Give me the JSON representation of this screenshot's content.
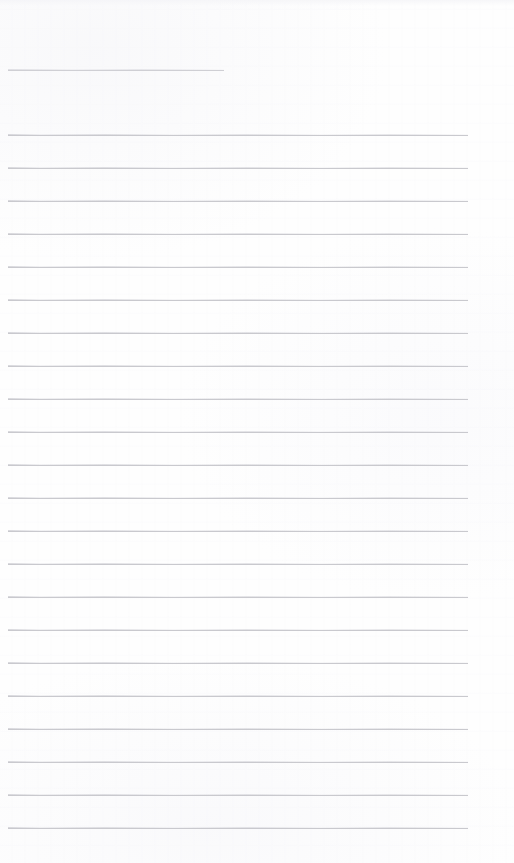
{
  "page": {
    "kind": "ruled-notebook-page",
    "width": 514,
    "height": 863,
    "background_color": "#fefefe",
    "content_text": "",
    "is_blank": true
  },
  "ruling": {
    "line_color": "#c9c9ce",
    "title_line_color": "#cfcfd4",
    "line_thickness_px": 1,
    "line_spacing_px": 33,
    "left_margin_px": 8,
    "right_edge_px": 468,
    "top_margin_px": 60,
    "bottom_margin_px": 35,
    "full_width_line_count": 22,
    "title_line_count": 1
  },
  "title_rule": {
    "y": 70,
    "x": 8,
    "width": 216,
    "label": "title-line",
    "value": ""
  },
  "body_rules": [
    {
      "y": 135,
      "x": 8,
      "width": 460,
      "value": ""
    },
    {
      "y": 168,
      "x": 8,
      "width": 460,
      "value": ""
    },
    {
      "y": 201,
      "x": 8,
      "width": 460,
      "value": ""
    },
    {
      "y": 234,
      "x": 8,
      "width": 460,
      "value": ""
    },
    {
      "y": 267,
      "x": 8,
      "width": 460,
      "value": ""
    },
    {
      "y": 300,
      "x": 8,
      "width": 460,
      "value": ""
    },
    {
      "y": 333,
      "x": 8,
      "width": 460,
      "value": ""
    },
    {
      "y": 366,
      "x": 8,
      "width": 460,
      "value": ""
    },
    {
      "y": 399,
      "x": 8,
      "width": 460,
      "value": ""
    },
    {
      "y": 432,
      "x": 8,
      "width": 460,
      "value": ""
    },
    {
      "y": 465,
      "x": 8,
      "width": 460,
      "value": ""
    },
    {
      "y": 498,
      "x": 8,
      "width": 460,
      "value": ""
    },
    {
      "y": 531,
      "x": 8,
      "width": 460,
      "value": ""
    },
    {
      "y": 564,
      "x": 8,
      "width": 460,
      "value": ""
    },
    {
      "y": 597,
      "x": 8,
      "width": 460,
      "value": ""
    },
    {
      "y": 630,
      "x": 8,
      "width": 460,
      "value": ""
    },
    {
      "y": 663,
      "x": 8,
      "width": 460,
      "value": ""
    },
    {
      "y": 696,
      "x": 8,
      "width": 460,
      "value": ""
    },
    {
      "y": 729,
      "x": 8,
      "width": 460,
      "value": ""
    },
    {
      "y": 762,
      "x": 8,
      "width": 460,
      "value": ""
    },
    {
      "y": 795,
      "x": 8,
      "width": 460,
      "value": ""
    },
    {
      "y": 828,
      "x": 8,
      "width": 460,
      "value": ""
    }
  ]
}
